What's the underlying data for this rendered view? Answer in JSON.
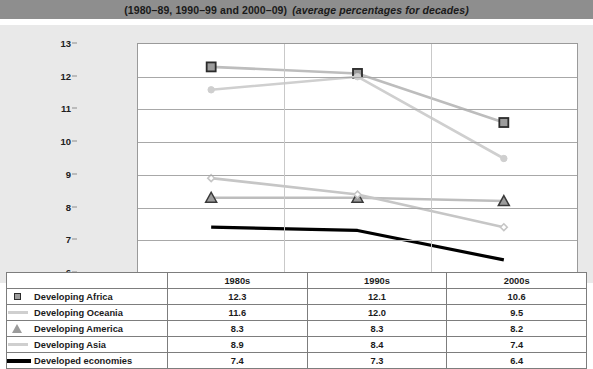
{
  "title": {
    "range_text": "(1980–89, 1990–99 and 2000–09)",
    "subtitle_text": "(average percentages for decades)"
  },
  "colors": {
    "title_band": "#8e8e8e",
    "panel_background": "#e9e9e9",
    "plot_background": "#ffffff",
    "gridline": "#a8a8a8",
    "africa": "#bdbdbd",
    "africa_marker_fill": "#9c9c9c",
    "africa_marker_border": "#2b2b2b",
    "oceania": "#cfcfcf",
    "america": "#bdbdbd",
    "america_marker_fill": "#9c9c9c",
    "america_marker_border": "#3a3a3a",
    "asia": "#c6c6c6",
    "developed": "#000000"
  },
  "chart_data": {
    "type": "line",
    "title": "(1980–89, 1990–99 and 2000–09) (average percentages for decades)",
    "xlabel": "",
    "ylabel": "",
    "categories": [
      "1980s",
      "1990s",
      "2000s"
    ],
    "ylim": [
      6,
      13
    ],
    "yticks": [
      6,
      7,
      8,
      9,
      10,
      11,
      12,
      13
    ],
    "ytick_labels": [
      "6",
      "7",
      "8",
      "9",
      "10",
      "11",
      "12",
      "13"
    ],
    "grid": true,
    "legend_position": "table-below",
    "series": [
      {
        "name": "Developing Africa",
        "values": [
          12.3,
          12.1,
          10.6
        ],
        "marker": "square",
        "color": "#bdbdbd"
      },
      {
        "name": "Developing Oceania",
        "values": [
          11.6,
          12.0,
          9.5
        ],
        "marker": "circle",
        "color": "#cfcfcf"
      },
      {
        "name": "Developing America",
        "values": [
          8.3,
          8.3,
          8.2
        ],
        "marker": "triangle",
        "color": "#bdbdbd"
      },
      {
        "name": "Developing Asia",
        "values": [
          8.9,
          8.4,
          7.4
        ],
        "marker": "diamond",
        "color": "#c6c6c6"
      },
      {
        "name": "Developed economies",
        "values": [
          7.4,
          7.3,
          6.4
        ],
        "marker": "none",
        "color": "#000000"
      }
    ]
  },
  "table": {
    "corner_label": "",
    "column_headers": [
      "1980s",
      "1990s",
      "2000s"
    ],
    "rows": [
      {
        "marker": "square",
        "label": "Developing Africa",
        "values": [
          "12.3",
          "12.1",
          "10.6"
        ]
      },
      {
        "marker": "line",
        "label": "Developing Oceania",
        "values": [
          "11.6",
          "12.0",
          "9.5"
        ]
      },
      {
        "marker": "triangle",
        "label": "Developing America",
        "values": [
          "8.3",
          "8.3",
          "8.2"
        ]
      },
      {
        "marker": "line",
        "label": "Developing Asia",
        "values": [
          "8.9",
          "8.4",
          "7.4"
        ]
      },
      {
        "marker": "thickline",
        "label": "Developed economies",
        "values": [
          "7.4",
          "7.3",
          "6.4"
        ]
      }
    ]
  }
}
